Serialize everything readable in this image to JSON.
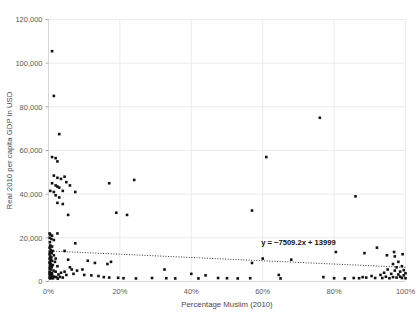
{
  "chart_data": {
    "type": "scatter",
    "title": "",
    "xlabel": "Percentage Muslim (2010)",
    "ylabel": "Real 2010 per capita GDP in USD",
    "xlim": [
      0,
      100
    ],
    "ylim": [
      0,
      120000
    ],
    "grid": true,
    "legend": null,
    "xticks": [
      "0%",
      "20%",
      "40%",
      "60%",
      "80%",
      "100%"
    ],
    "xtick_values": [
      0,
      20,
      40,
      60,
      80,
      100
    ],
    "yticks": [
      "0",
      "20,000",
      "40,000",
      "60,000",
      "80,000",
      "100,000",
      "120,000"
    ],
    "ytick_values": [
      0,
      20000,
      40000,
      60000,
      80000,
      100000,
      120000
    ],
    "marker": {
      "shape": "square",
      "color": "#111111",
      "size": 2.6
    },
    "annotations": [
      {
        "name": "trendline-equation",
        "text": "y = −7509.2x + 13999",
        "x": 70,
        "y": 16500
      }
    ],
    "trendline": {
      "slope": -7509.2,
      "intercept": 13999,
      "style": "dotted",
      "color": "#333333",
      "x_start": 0,
      "x_end": 100,
      "y_start": 13999,
      "y_end": 6490
    },
    "points": [
      [
        1.0,
        105500
      ],
      [
        1.5,
        85000
      ],
      [
        3.0,
        67500
      ],
      [
        1.0,
        57000
      ],
      [
        2.0,
        56500
      ],
      [
        2.5,
        55000
      ],
      [
        61.0,
        57000
      ],
      [
        76.0,
        75000
      ],
      [
        1.5,
        48500
      ],
      [
        2.5,
        47500
      ],
      [
        3.5,
        47000
      ],
      [
        4.5,
        48000
      ],
      [
        1.0,
        45000
      ],
      [
        2.0,
        44000
      ],
      [
        2.5,
        43500
      ],
      [
        3.0,
        43000
      ],
      [
        5.0,
        45500
      ],
      [
        6.0,
        44000
      ],
      [
        17.0,
        45000
      ],
      [
        24.0,
        46500
      ],
      [
        0.5,
        41500
      ],
      [
        1.5,
        41000
      ],
      [
        4.0,
        41500
      ],
      [
        7.5,
        41000
      ],
      [
        2.0,
        39500
      ],
      [
        3.0,
        38500
      ],
      [
        2.5,
        36000
      ],
      [
        4.0,
        35500
      ],
      [
        19.0,
        31500
      ],
      [
        22.0,
        30500
      ],
      [
        5.5,
        30500
      ],
      [
        57.0,
        32500
      ],
      [
        86.0,
        39000
      ],
      [
        0.3,
        22000
      ],
      [
        0.5,
        21500
      ],
      [
        1.0,
        21000
      ],
      [
        2.5,
        22000
      ],
      [
        0.3,
        20000
      ],
      [
        0.8,
        19500
      ],
      [
        1.5,
        19000
      ],
      [
        0.4,
        18000
      ],
      [
        7.5,
        17500
      ],
      [
        0.5,
        16500
      ],
      [
        1.0,
        16000
      ],
      [
        0.3,
        15500
      ],
      [
        0.6,
        14500
      ],
      [
        1.2,
        14000
      ],
      [
        4.5,
        14000
      ],
      [
        0.4,
        13500
      ],
      [
        0.9,
        13000
      ],
      [
        0.3,
        12500
      ],
      [
        1.5,
        12000
      ],
      [
        0.5,
        11500
      ],
      [
        0.8,
        11000
      ],
      [
        0.3,
        10500
      ],
      [
        2.0,
        10500
      ],
      [
        5.5,
        10000
      ],
      [
        0.6,
        10000
      ],
      [
        1.0,
        9500
      ],
      [
        0.4,
        9000
      ],
      [
        1.8,
        9000
      ],
      [
        11.0,
        9500
      ],
      [
        13.0,
        8500
      ],
      [
        16.5,
        8000
      ],
      [
        17.5,
        9000
      ],
      [
        0.3,
        8500
      ],
      [
        0.7,
        8000
      ],
      [
        0.5,
        7500
      ],
      [
        1.2,
        7500
      ],
      [
        2.5,
        7000
      ],
      [
        0.4,
        7000
      ],
      [
        0.9,
        6500
      ],
      [
        0.3,
        6000
      ],
      [
        6.0,
        6500
      ],
      [
        6.5,
        5500
      ],
      [
        8.0,
        5000
      ],
      [
        9.5,
        5500
      ],
      [
        0.6,
        5500
      ],
      [
        1.4,
        5000
      ],
      [
        0.3,
        4500
      ],
      [
        2.0,
        4500
      ],
      [
        3.5,
        4000
      ],
      [
        4.5,
        4500
      ],
      [
        0.5,
        4000
      ],
      [
        1.0,
        3800
      ],
      [
        0.3,
        3500
      ],
      [
        0.8,
        3300
      ],
      [
        2.8,
        3200
      ],
      [
        5.0,
        3000
      ],
      [
        7.0,
        3500
      ],
      [
        10.0,
        3000
      ],
      [
        12.0,
        2800
      ],
      [
        14.0,
        2500
      ],
      [
        0.4,
        2800
      ],
      [
        1.1,
        2600
      ],
      [
        0.6,
        2300
      ],
      [
        1.6,
        2200
      ],
      [
        2.2,
        2000
      ],
      [
        3.2,
        2100
      ],
      [
        4.0,
        1800
      ],
      [
        0.3,
        1800
      ],
      [
        0.9,
        1600
      ],
      [
        1.3,
        1500
      ],
      [
        0.5,
        1400
      ],
      [
        2.6,
        1300
      ],
      [
        15.5,
        2000
      ],
      [
        17.0,
        1800
      ],
      [
        19.5,
        1700
      ],
      [
        21.0,
        1500
      ],
      [
        24.5,
        1400
      ],
      [
        29.0,
        1600
      ],
      [
        32.5,
        5500
      ],
      [
        33.0,
        1500
      ],
      [
        35.5,
        1400
      ],
      [
        40.0,
        3500
      ],
      [
        42.0,
        1400
      ],
      [
        44.0,
        2800
      ],
      [
        47.5,
        1600
      ],
      [
        50.0,
        1500
      ],
      [
        53.0,
        1400
      ],
      [
        56.5,
        1500
      ],
      [
        57.0,
        8500
      ],
      [
        60.0,
        10500
      ],
      [
        64.5,
        3000
      ],
      [
        65.0,
        1400
      ],
      [
        68.0,
        10000
      ],
      [
        77.0,
        2000
      ],
      [
        80.0,
        1500
      ],
      [
        80.5,
        13500
      ],
      [
        83.0,
        1400
      ],
      [
        85.5,
        1600
      ],
      [
        87.0,
        1500
      ],
      [
        88.0,
        2000
      ],
      [
        88.5,
        13000
      ],
      [
        89.0,
        1800
      ],
      [
        90.5,
        2500
      ],
      [
        91.5,
        1600
      ],
      [
        92.0,
        15500
      ],
      [
        93.0,
        3000
      ],
      [
        93.5,
        1600
      ],
      [
        94.0,
        4000
      ],
      [
        94.5,
        2200
      ],
      [
        95.0,
        5500
      ],
      [
        95.5,
        1500
      ],
      [
        96.0,
        3500
      ],
      [
        96.5,
        8000
      ],
      [
        96.5,
        2000
      ],
      [
        97.0,
        5000
      ],
      [
        97.0,
        11500
      ],
      [
        97.5,
        1800
      ],
      [
        97.5,
        6500
      ],
      [
        98.0,
        3200
      ],
      [
        98.0,
        9000
      ],
      [
        98.5,
        2200
      ],
      [
        98.5,
        4500
      ],
      [
        99.0,
        1600
      ],
      [
        99.0,
        7000
      ],
      [
        99.5,
        2800
      ],
      [
        99.5,
        5200
      ],
      [
        100.0,
        1500
      ],
      [
        100.0,
        3800
      ],
      [
        99.2,
        12500
      ],
      [
        96.8,
        13500
      ],
      [
        94.8,
        12000
      ]
    ]
  }
}
